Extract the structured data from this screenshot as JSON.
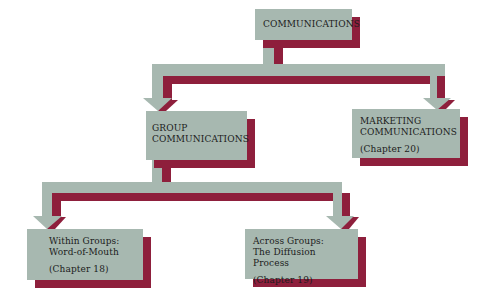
{
  "diagram": {
    "type": "hierarchy",
    "colors": {
      "box": "#a7b8b0",
      "shadow": "#8e1f3c",
      "text": "#1c1c1c",
      "background": "#ffffff"
    },
    "nodes": {
      "root": {
        "title_lines": [
          "COMMUNICATIONS"
        ]
      },
      "group": {
        "title_lines": [
          "GROUP",
          "COMMUNICATIONS"
        ]
      },
      "marketing": {
        "title_lines": [
          "MARKETING",
          "COMMUNICATIONS"
        ],
        "chapter": "(Chapter 20)"
      },
      "within": {
        "title_lines": [
          "Within Groups:",
          "Word-of-Mouth"
        ],
        "chapter": "(Chapter 18)"
      },
      "across": {
        "title_lines": [
          "Across Groups:",
          "The Diffusion Process"
        ],
        "chapter": "(Chapter 19)"
      }
    },
    "edges": [
      {
        "from": "root",
        "to": "group"
      },
      {
        "from": "root",
        "to": "marketing"
      },
      {
        "from": "group",
        "to": "within"
      },
      {
        "from": "group",
        "to": "across"
      }
    ]
  }
}
